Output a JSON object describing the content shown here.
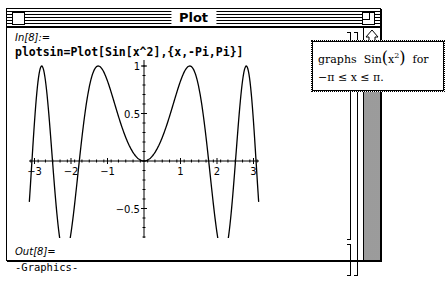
{
  "window": {
    "title": "Plot"
  },
  "cell_input": {
    "label": "In[8]:=",
    "code": "plotsin=Plot[Sin[x^2],{x,-Pi,Pi}]"
  },
  "cell_output": {
    "label": "Out[8]=",
    "value": "-Graphics-"
  },
  "tooltip": {
    "line1_prefix": "graphs",
    "line1_func": "Sin",
    "line1_arg": "x",
    "line1_exp": "2",
    "line1_suffix": "for",
    "line2": "−π ≤ x ≤ π."
  },
  "icons": {
    "close_box": "close-box-icon",
    "zoom_box": "zoom-box-icon",
    "scroll_up": "scroll-up-arrow-icon"
  },
  "chart_data": {
    "type": "line",
    "title": "",
    "function": "Sin[x^2]",
    "xlabel": "",
    "ylabel": "",
    "xlim": [
      -3.1416,
      3.1416
    ],
    "ylim": [
      -1,
      1
    ],
    "x_ticks": [
      "-3",
      "-2",
      "-1",
      "1",
      "2",
      "3"
    ],
    "y_ticks": [
      "-1",
      "-0.5",
      "0.5",
      "1"
    ],
    "grid": false,
    "x": [
      -3.14,
      -3.0,
      -2.8,
      -2.5,
      -2.17,
      -2.0,
      -1.77,
      -1.5,
      -1.25,
      -1.0,
      -0.5,
      0,
      0.5,
      1.0,
      1.25,
      1.5,
      1.77,
      2.0,
      2.17,
      2.5,
      2.8,
      3.0,
      3.14
    ],
    "y": [
      -0.43,
      0.41,
      1.0,
      -0.03,
      -1.0,
      -0.76,
      0.0,
      0.78,
      1.0,
      0.84,
      0.25,
      0,
      0.25,
      0.84,
      1.0,
      0.78,
      0.0,
      -0.76,
      -1.0,
      -0.03,
      1.0,
      0.41,
      -0.43
    ]
  }
}
